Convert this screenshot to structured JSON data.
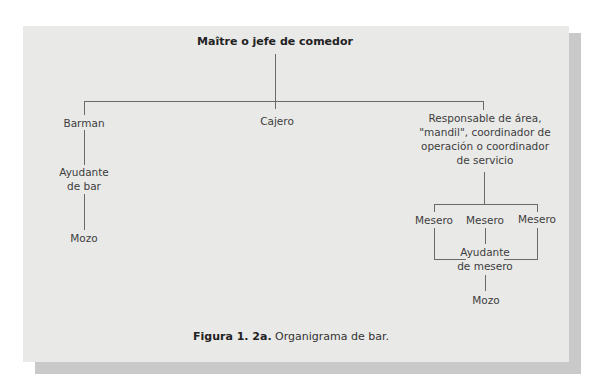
{
  "diagram": {
    "root": "Maître o jefe de comedor",
    "branches": {
      "barman": {
        "label": "Barman",
        "children": {
          "ayudante_bar": {
            "line1": "Ayudante",
            "line2": "de bar"
          },
          "mozo": "Mozo"
        }
      },
      "cajero": {
        "label": "Cajero"
      },
      "responsable": {
        "lines": [
          "Responsable de área,",
          "\"mandil\", coordinador de",
          "operación o coordinador",
          "de servicio"
        ],
        "meseros": [
          "Mesero",
          "Mesero",
          "Mesero"
        ],
        "ayudante_mesero": {
          "line1": "Ayudante",
          "line2": "de mesero"
        },
        "mozo": "Mozo"
      }
    }
  },
  "caption": {
    "label": "Figura 1. 2a.",
    "text": " Organigrama de bar."
  },
  "colors": {
    "card": "#e9e9e8",
    "shadow": "#c9c9c9",
    "line": "#6a6a6a",
    "text": "#3d3d3d"
  }
}
